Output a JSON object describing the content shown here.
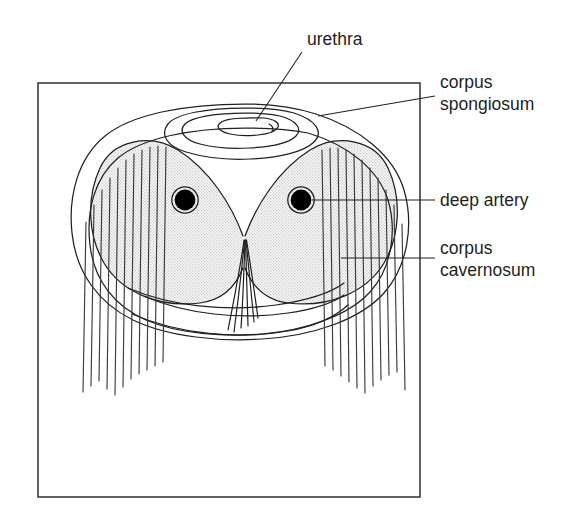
{
  "figure": {
    "background_color": "#ffffff",
    "frame": {
      "name": "diagram-border",
      "x": 38,
      "y": 83,
      "width": 382,
      "height": 414,
      "stroke_color": "#3d3d3d"
    }
  },
  "labels": [
    {
      "id": "urethra",
      "text": "urethra",
      "x": 307,
      "y": 45,
      "anchor": "start",
      "leader": {
        "from_x": 302,
        "from_y": 52,
        "to_x": 256,
        "to_y": 121
      }
    },
    {
      "id": "corpus-spongiosum",
      "text_line1": "corpus",
      "text_line2": "spongiosum",
      "x": 440,
      "y": 88,
      "anchor": "start",
      "leader": {
        "from_x": 435,
        "from_y": 96,
        "to_x": 318,
        "to_y": 116
      }
    },
    {
      "id": "deep-artery",
      "text": "deep artery",
      "x": 440,
      "y": 206,
      "anchor": "start",
      "leader": {
        "from_x": 435,
        "from_y": 200,
        "to_x": 312,
        "to_y": 200
      }
    },
    {
      "id": "corpus-cavernosum",
      "text_line1": "corpus",
      "text_line2": "cavernosum",
      "x": 440,
      "y": 254,
      "anchor": "start",
      "leader": {
        "from_x": 435,
        "from_y": 258,
        "to_x": 341,
        "to_y": 258
      }
    }
  ],
  "structures": {
    "tunica_outer": {
      "name": "outer-tunica-outline",
      "description": "outermost elliptical capsule of the cross-section"
    },
    "tunica_inner": {
      "name": "inner-tunica-outline",
      "description": "inner elliptical boundary of the tunica albuginea"
    },
    "corpus_cavernosum": {
      "name": "corpus-cavernosum-shading",
      "fill_color": "#e2e2e2",
      "description": "paired shaded erectile bodies forming heart-shaped mass"
    },
    "corpus_spongiosum": {
      "name": "corpus-spongiosum-rings",
      "description": "concentric ellipses surrounding the urethra at top"
    },
    "urethra_lumen": {
      "name": "urethra-lumen",
      "description": "small central ellipse, the urethral opening"
    },
    "deep_arteries": [
      {
        "name": "deep-artery-left",
        "cx": 185,
        "cy": 200,
        "r_fill": 10.5,
        "r_ring": 13.5
      },
      {
        "name": "deep-artery-right",
        "cx": 301,
        "cy": 200,
        "r_fill": 10.5,
        "r_ring": 13.5
      }
    ],
    "septum": {
      "name": "septum-fiber-bundle",
      "strand_count": 6,
      "description": "central vertical bundle of fibers descending from the notch"
    },
    "fiber_bundles": {
      "left": {
        "name": "fascial-fibers-left",
        "strand_count": 11
      },
      "right": {
        "name": "fascial-fibers-right",
        "strand_count": 11
      }
    },
    "ventral_vessels": {
      "name": "ventral-vessel-curves",
      "curve_count": 3,
      "description": "curved vein and nerve lines along the ventral surface"
    }
  },
  "colors": {
    "ink": "#231f20",
    "shading": "#e2e2e2",
    "frame": "#3d3d3d",
    "paper": "#ffffff"
  }
}
